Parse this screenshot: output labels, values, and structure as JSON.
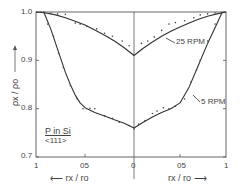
{
  "chart_data": {
    "type": "line",
    "title": "",
    "xlabel_left": "r_x / r_0",
    "xlabel_right": "r_x / r_0",
    "ylabel": "ρ_x / ρ_0",
    "x_ticks": [
      "1",
      "0.5",
      "0",
      "0.5",
      "1"
    ],
    "x_tick_labels_display": [
      "1",
      "05",
      "0",
      "05",
      "1"
    ],
    "y_ticks": [
      "1.0",
      "0.9",
      "0.8",
      "0.7"
    ],
    "y_tick_labels_display": [
      "1.0",
      "0.9",
      "0.8",
      "0.7"
    ],
    "ylim": [
      0.7,
      1.0
    ],
    "xlim": [
      -1,
      1
    ],
    "annotation": {
      "line1": "P in Si",
      "line2": "<111>"
    },
    "series": [
      {
        "name": "25 RPM",
        "label": "25 RPM",
        "x": [
          -1.0,
          -0.9,
          -0.8,
          -0.7,
          -0.6,
          -0.5,
          -0.4,
          -0.3,
          -0.2,
          -0.1,
          0.0,
          0.1,
          0.2,
          0.3,
          0.4,
          0.5,
          0.6,
          0.7,
          0.8,
          0.9,
          1.0
        ],
        "y": [
          1.0,
          0.998,
          0.994,
          0.988,
          0.981,
          0.973,
          0.963,
          0.952,
          0.94,
          0.926,
          0.91,
          0.925,
          0.938,
          0.95,
          0.96,
          0.969,
          0.977,
          0.985,
          0.991,
          0.996,
          1.0
        ],
        "points": [
          [
            -0.95,
            1.0
          ],
          [
            -0.85,
            0.997
          ],
          [
            -0.78,
            0.996
          ],
          [
            -0.7,
            0.995
          ],
          [
            -0.6,
            0.977
          ],
          [
            -0.55,
            0.975
          ],
          [
            -0.48,
            0.97
          ],
          [
            -0.38,
            0.965
          ],
          [
            -0.3,
            0.956
          ],
          [
            -0.22,
            0.95
          ],
          [
            -0.12,
            0.94
          ],
          [
            -0.05,
            0.93
          ],
          [
            0.08,
            0.935
          ],
          [
            0.15,
            0.94
          ],
          [
            0.22,
            0.948
          ],
          [
            0.3,
            0.962
          ],
          [
            0.38,
            0.975
          ],
          [
            0.45,
            0.978
          ],
          [
            0.55,
            0.982
          ],
          [
            0.65,
            0.988
          ],
          [
            0.72,
            0.994
          ],
          [
            0.8,
            0.996
          ],
          [
            0.88,
            0.998
          ]
        ]
      },
      {
        "name": "5 RPM",
        "label": "5 RPM",
        "x": [
          -0.92,
          -0.85,
          -0.8,
          -0.75,
          -0.7,
          -0.65,
          -0.6,
          -0.55,
          -0.5,
          -0.4,
          -0.3,
          -0.2,
          -0.1,
          0.0,
          0.1,
          0.2,
          0.3,
          0.4,
          0.5,
          0.6,
          0.7,
          0.8,
          0.9,
          0.96
        ],
        "y": [
          1.0,
          0.965,
          0.935,
          0.905,
          0.875,
          0.85,
          0.828,
          0.812,
          0.802,
          0.792,
          0.785,
          0.777,
          0.77,
          0.76,
          0.772,
          0.783,
          0.792,
          0.8,
          0.812,
          0.845,
          0.89,
          0.935,
          0.975,
          1.0
        ],
        "points": [
          [
            -0.92,
            1.0
          ],
          [
            -0.88,
            0.975
          ],
          [
            -0.82,
            0.95
          ],
          [
            -0.77,
            0.915
          ],
          [
            -0.72,
            0.885
          ],
          [
            -0.65,
            0.848
          ],
          [
            -0.58,
            0.82
          ],
          [
            -0.52,
            0.8
          ],
          [
            -0.45,
            0.801
          ],
          [
            -0.4,
            0.8
          ],
          [
            -0.3,
            0.785
          ],
          [
            -0.22,
            0.78
          ],
          [
            -0.15,
            0.772
          ],
          [
            -0.05,
            0.765
          ],
          [
            0.0,
            0.758
          ],
          [
            0.05,
            0.768
          ],
          [
            0.12,
            0.775
          ],
          [
            0.2,
            0.79
          ],
          [
            0.25,
            0.795
          ],
          [
            0.32,
            0.802
          ],
          [
            0.38,
            0.8
          ],
          [
            0.45,
            0.805
          ],
          [
            0.55,
            0.82
          ],
          [
            0.62,
            0.855
          ],
          [
            0.68,
            0.88
          ],
          [
            0.72,
            0.9
          ],
          [
            0.8,
            0.94
          ],
          [
            0.88,
            0.975
          ]
        ]
      }
    ]
  },
  "labels": {
    "y_title": "ρx / ρo",
    "x_title_left": "rx / ro",
    "x_title_right": "rx / ro",
    "series_25": "25 RPM",
    "series_5": "5 RPM",
    "sample_name": "P in Si",
    "sample_orientation": "<111>"
  },
  "colors": {
    "axis": "#555555",
    "curve": "#333333",
    "point": "#444444",
    "background": "#ffffff"
  }
}
